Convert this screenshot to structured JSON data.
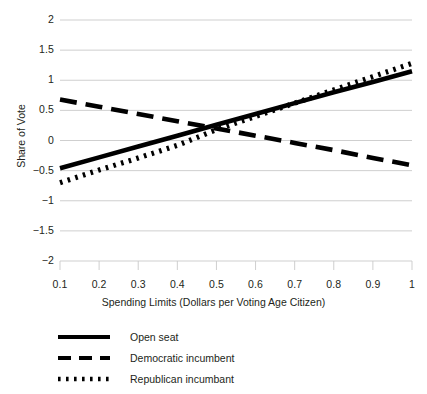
{
  "chart_data": {
    "type": "line",
    "title": "",
    "xlabel": "Spending Limits (Dollars per Voting Age Citizen)",
    "ylabel": "Share of Vote",
    "xlim": [
      0.1,
      1.0
    ],
    "ylim": [
      -2,
      2
    ],
    "grid": true,
    "legend_position": "below",
    "xticks": [
      "0.1",
      "0.2",
      "0.3",
      "0.4",
      "0.5",
      "0.6",
      "0.7",
      "0.8",
      "0.9",
      "1"
    ],
    "xtick_values": [
      0.1,
      0.2,
      0.3,
      0.4,
      0.5,
      0.6,
      0.7,
      0.8,
      0.9,
      1.0
    ],
    "yticks": [
      "2",
      "1.5",
      "1",
      "0.5",
      "0",
      "-0.5",
      "-1",
      "-1.5",
      "-2"
    ],
    "ytick_values": [
      2,
      1.5,
      1,
      0.5,
      0,
      -0.5,
      -1,
      -1.5,
      -2
    ],
    "x": [
      0.1,
      0.2,
      0.3,
      0.4,
      0.5,
      0.6,
      0.7,
      0.8,
      0.9,
      1.0
    ],
    "series": [
      {
        "name": "Open seat",
        "style": "solid",
        "color": "#000000",
        "values": [
          -0.46,
          -0.28,
          -0.1,
          0.08,
          0.26,
          0.44,
          0.62,
          0.8,
          0.97,
          1.15
        ]
      },
      {
        "name": "Democratic incumbent",
        "style": "dashed",
        "color": "#000000",
        "values": [
          0.68,
          0.56,
          0.44,
          0.32,
          0.2,
          0.08,
          -0.04,
          -0.16,
          -0.29,
          -0.41
        ]
      },
      {
        "name": "Republican incumbant",
        "style": "dotted",
        "color": "#000000",
        "values": [
          -0.7,
          -0.49,
          -0.29,
          -0.08,
          0.18,
          0.4,
          0.62,
          0.84,
          1.06,
          1.28
        ]
      }
    ]
  },
  "axes": {
    "y_title": "Share of Vote",
    "x_title": "Spending Limits (Dollars per Voting Age Citizen)"
  },
  "legend": {
    "items": [
      {
        "label": "Open seat",
        "style": "solid"
      },
      {
        "label": "Democratic incumbent",
        "style": "dashed"
      },
      {
        "label": "Republican incumbant",
        "style": "dotted"
      }
    ]
  },
  "colors": {
    "ink": "#231f20",
    "line": "#000000",
    "grid": "#c9c9c9",
    "background": "#ffffff"
  }
}
